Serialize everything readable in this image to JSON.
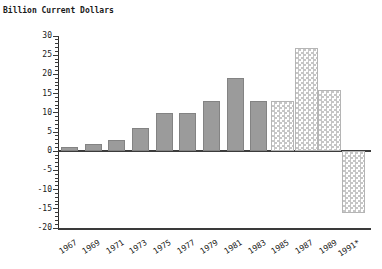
{
  "chart": {
    "title": "Billion Current Dollars"
  },
  "chart_data": {
    "type": "bar",
    "title": "Billion Current Dollars",
    "xlabel": "",
    "ylabel": "Billion Current Dollars",
    "categories": [
      "1967",
      "1969",
      "1971",
      "1973",
      "1975",
      "1977",
      "1979",
      "1981",
      "1983",
      "1985",
      "1987",
      "1989",
      "1991*"
    ],
    "values": [
      1,
      2,
      3,
      6,
      10,
      10,
      13,
      19,
      13,
      13,
      27,
      16,
      -16
    ],
    "bar_styles": [
      "solid",
      "solid",
      "solid",
      "solid",
      "solid",
      "solid",
      "solid",
      "solid",
      "solid",
      "hatched",
      "hatched",
      "hatched",
      "hatched"
    ],
    "ylim": [
      -20,
      30
    ],
    "yticks": [
      30,
      25,
      20,
      15,
      10,
      5,
      0,
      -5,
      -10,
      -15,
      -20
    ],
    "ytick_major_step": 5,
    "ytick_minor_step": 1,
    "grid": false,
    "legend": "none",
    "colors": {
      "solid_bar_fill": "#9b9b9b",
      "solid_bar_edge": "#838383",
      "hatched_bar_squares": "#c6c6c6",
      "hatched_bar_bg": "#ffffff",
      "axis": "#3a3a3a",
      "text": "#1a1a1a",
      "background": "#ffffff"
    }
  }
}
